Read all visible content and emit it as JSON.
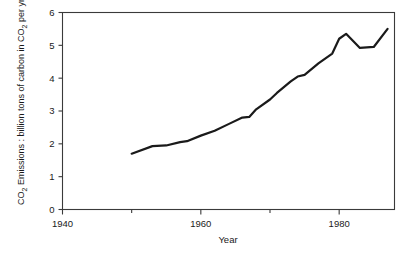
{
  "chart_data": {
    "type": "line",
    "title": "",
    "xlabel": "Year",
    "ylabel": "CO2 Emissions : billion tons of carbon in CO2 per yr.",
    "ylabel_parts": {
      "prefix": "CO",
      "sub1": "2",
      "middle": " Emissions : billion tons of carbon in CO",
      "sub2": "2",
      "suffix": " per yr."
    },
    "xlim": [
      1940,
      1988
    ],
    "ylim": [
      0,
      6
    ],
    "grid": false,
    "legend": null,
    "x_major_ticks": [
      1940,
      1960,
      1980
    ],
    "x_major_tick_labels": [
      "1940",
      "1960",
      "1980"
    ],
    "x_minor_ticks": [
      1950,
      1970
    ],
    "y_ticks": [
      0,
      1,
      2,
      3,
      4,
      5,
      6
    ],
    "y_tick_labels": [
      "0",
      "1",
      "2",
      "3",
      "4",
      "5",
      "6"
    ],
    "series": [
      {
        "name": "CO2 emissions",
        "color": "#1a1a1a",
        "x": [
          1950,
          1953,
          1955,
          1957,
          1958,
          1960,
          1962,
          1964,
          1966,
          1967,
          1968,
          1970,
          1971,
          1973,
          1974,
          1975,
          1977,
          1979,
          1980,
          1981,
          1983,
          1985,
          1987
        ],
        "values": [
          1.7,
          1.93,
          1.95,
          2.05,
          2.08,
          2.25,
          2.4,
          2.6,
          2.8,
          2.82,
          3.05,
          3.35,
          3.55,
          3.9,
          4.05,
          4.1,
          4.45,
          4.75,
          5.2,
          5.35,
          4.92,
          4.95,
          5.5
        ]
      }
    ]
  },
  "axis": {
    "x_title": "Year"
  }
}
